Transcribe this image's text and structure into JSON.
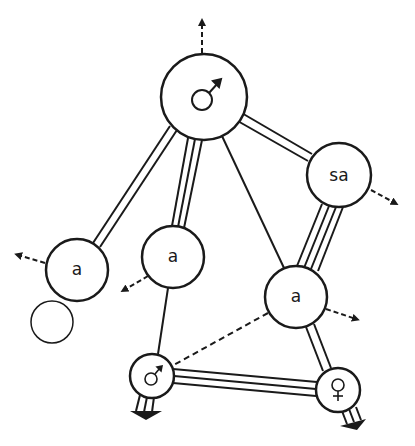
{
  "diagram": {
    "type": "sociogram / kinship role network",
    "nodes": [
      {
        "id": "top_male",
        "label": "♂",
        "symbol": "male-symbol",
        "x": 204,
        "y": 97,
        "r": 43
      },
      {
        "id": "sa",
        "label": "sa",
        "x": 339,
        "y": 175,
        "r": 32
      },
      {
        "id": "a_left",
        "label": "a",
        "x": 77,
        "y": 270,
        "r": 31
      },
      {
        "id": "a_mid",
        "label": "a",
        "x": 173,
        "y": 257,
        "r": 31
      },
      {
        "id": "a_right",
        "label": "a",
        "x": 296,
        "y": 297,
        "r": 31
      },
      {
        "id": "small_male",
        "label": "♂",
        "symbol": "male-symbol",
        "x": 152,
        "y": 376,
        "r": 22
      },
      {
        "id": "female",
        "label": "♀",
        "symbol": "female-symbol",
        "x": 338,
        "y": 390,
        "r": 22
      }
    ],
    "edges": [
      {
        "from": "top_male",
        "to": "a_left",
        "lines": 2
      },
      {
        "from": "top_male",
        "to": "a_mid",
        "lines": 3
      },
      {
        "from": "top_male",
        "to": "a_right",
        "lines": 1
      },
      {
        "from": "top_male",
        "to": "sa",
        "lines": 2
      },
      {
        "from": "sa",
        "to": "a_right",
        "lines": 4
      },
      {
        "from": "a_mid",
        "to": "small_male",
        "lines": 1
      },
      {
        "from": "a_right",
        "to": "small_male",
        "lines": 1,
        "style": "dashed"
      },
      {
        "from": "a_right",
        "to": "female",
        "lines": 2
      },
      {
        "from": "small_male",
        "to": "female",
        "lines": 3
      }
    ],
    "self_loops": [
      {
        "node": "a_left",
        "cx": 52,
        "cy": 322,
        "r": 21
      }
    ],
    "outgoing_dashed_arrows": [
      {
        "from": "top_male",
        "direction": "up"
      },
      {
        "from": "sa",
        "direction": "down-right"
      },
      {
        "from": "a_left",
        "direction": "left"
      },
      {
        "from": "a_mid",
        "direction": "down-left"
      },
      {
        "from": "a_right",
        "direction": "right"
      }
    ],
    "grounded_outputs": [
      {
        "from": "small_male",
        "lines": 3,
        "direction": "down"
      },
      {
        "from": "female",
        "lines": 3,
        "direction": "down-right"
      }
    ],
    "colors": {
      "ink": "#1a1a1a",
      "background": "#ffffff"
    }
  }
}
